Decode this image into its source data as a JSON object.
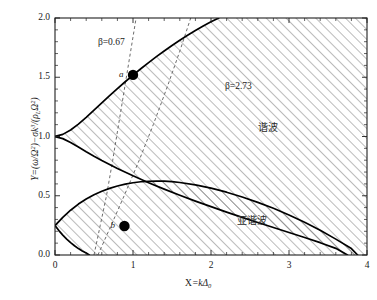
{
  "chart_data": {
    "type": "line",
    "title": "",
    "xlabel": "X=kΔ₀",
    "ylabel": "Y=(ω/Ω)²−σk³/(ρₗΩ²)",
    "xlim": [
      0,
      4
    ],
    "ylim": [
      0,
      2.0
    ],
    "grid": false,
    "legend": "none",
    "xticks": [
      "0",
      "1",
      "2",
      "3",
      "4"
    ],
    "xtick_values": [
      0,
      1,
      2,
      3,
      4
    ],
    "yticks": [
      "0.0",
      "0.5",
      "1.0",
      "1.5",
      "2.0"
    ],
    "ytick_values": [
      0.0,
      0.5,
      1.0,
      1.5,
      2.0
    ],
    "xminor_count": 4,
    "yminor_count": 4,
    "series": [
      {
        "name": "harmonic-upper-boundary",
        "style": "solid",
        "points": [
          [
            0.0,
            1.0
          ],
          [
            0.1,
            1.018
          ],
          [
            0.2,
            1.055
          ],
          [
            0.3,
            1.105
          ],
          [
            0.4,
            1.162
          ],
          [
            0.5,
            1.222
          ],
          [
            0.6,
            1.283
          ],
          [
            0.7,
            1.344
          ],
          [
            0.8,
            1.404
          ],
          [
            0.9,
            1.462
          ],
          [
            1.0,
            1.518
          ],
          [
            1.1,
            1.572
          ],
          [
            1.2,
            1.624
          ],
          [
            1.3,
            1.674
          ],
          [
            1.4,
            1.722
          ],
          [
            1.5,
            1.768
          ],
          [
            1.6,
            1.812
          ],
          [
            1.7,
            1.854
          ],
          [
            1.8,
            1.894
          ],
          [
            1.9,
            1.932
          ],
          [
            2.0,
            1.968
          ],
          [
            2.1,
            2.0
          ]
        ]
      },
      {
        "name": "harmonic-lower-boundary",
        "style": "solid",
        "points": [
          [
            0.0,
            1.0
          ],
          [
            0.1,
            0.982
          ],
          [
            0.2,
            0.95
          ],
          [
            0.3,
            0.912
          ],
          [
            0.4,
            0.872
          ],
          [
            0.5,
            0.834
          ],
          [
            0.6,
            0.798
          ],
          [
            0.8,
            0.73
          ],
          [
            1.0,
            0.668
          ],
          [
            1.2,
            0.61
          ],
          [
            1.4,
            0.556
          ],
          [
            1.6,
            0.504
          ],
          [
            1.8,
            0.455
          ],
          [
            2.0,
            0.408
          ],
          [
            2.2,
            0.362
          ],
          [
            2.4,
            0.318
          ],
          [
            2.6,
            0.274
          ],
          [
            2.8,
            0.232
          ],
          [
            3.0,
            0.19
          ],
          [
            3.2,
            0.148
          ],
          [
            3.4,
            0.104
          ],
          [
            3.6,
            0.056
          ],
          [
            3.75,
            0.0
          ]
        ]
      },
      {
        "name": "subharmonic-upper-boundary",
        "style": "solid",
        "points": [
          [
            0.0,
            0.248
          ],
          [
            0.1,
            0.318
          ],
          [
            0.2,
            0.378
          ],
          [
            0.3,
            0.43
          ],
          [
            0.4,
            0.472
          ],
          [
            0.5,
            0.508
          ],
          [
            0.6,
            0.538
          ],
          [
            0.7,
            0.562
          ],
          [
            0.8,
            0.582
          ],
          [
            0.9,
            0.598
          ],
          [
            1.0,
            0.61
          ],
          [
            1.1,
            0.618
          ],
          [
            1.2,
            0.622
          ],
          [
            1.3,
            0.624
          ],
          [
            1.4,
            0.623
          ],
          [
            1.5,
            0.619
          ],
          [
            1.6,
            0.612
          ],
          [
            1.8,
            0.592
          ],
          [
            2.0,
            0.564
          ],
          [
            2.2,
            0.53
          ],
          [
            2.4,
            0.49
          ],
          [
            2.6,
            0.444
          ],
          [
            2.8,
            0.394
          ],
          [
            3.0,
            0.338
          ],
          [
            3.2,
            0.276
          ],
          [
            3.4,
            0.208
          ],
          [
            3.6,
            0.134
          ],
          [
            3.8,
            0.054
          ],
          [
            3.88,
            0.0
          ]
        ]
      },
      {
        "name": "subharmonic-lower-boundary",
        "style": "solid",
        "points": [
          [
            0.0,
            0.248
          ],
          [
            0.05,
            0.206
          ],
          [
            0.1,
            0.168
          ],
          [
            0.15,
            0.134
          ],
          [
            0.2,
            0.104
          ],
          [
            0.25,
            0.078
          ],
          [
            0.3,
            0.054
          ],
          [
            0.35,
            0.034
          ],
          [
            0.4,
            0.016
          ],
          [
            0.44,
            0.0
          ]
        ]
      },
      {
        "name": "beta-0.67-line",
        "style": "dashed",
        "points": [
          [
            0.5,
            0.0
          ],
          [
            0.58,
            0.25
          ],
          [
            0.66,
            0.5
          ],
          [
            0.74,
            0.8
          ],
          [
            0.82,
            1.12
          ],
          [
            0.9,
            1.44
          ],
          [
            0.97,
            1.72
          ],
          [
            1.04,
            2.0
          ]
        ]
      },
      {
        "name": "beta-2.73-line",
        "style": "dashed",
        "points": [
          [
            0.55,
            0.0
          ],
          [
            0.72,
            0.25
          ],
          [
            0.9,
            0.52
          ],
          [
            1.08,
            0.8
          ],
          [
            1.26,
            1.1
          ],
          [
            1.44,
            1.42
          ],
          [
            1.6,
            1.72
          ],
          [
            1.74,
            2.0
          ]
        ]
      }
    ],
    "markers": [
      {
        "label": "a",
        "x": 1.0,
        "y": 1.52,
        "shape": "filled-circle",
        "color": "#000000"
      },
      {
        "label": "b",
        "x": 0.89,
        "y": 0.245,
        "shape": "filled-circle",
        "color": "#000000"
      }
    ],
    "annotations": [
      {
        "name": "beta-low-label",
        "text": "β=0.67",
        "x": 0.55,
        "y": 1.78
      },
      {
        "name": "beta-high-label",
        "text": "β=2.73",
        "x": 2.18,
        "y": 1.41
      },
      {
        "name": "harmonic-region-label",
        "text": "谐波",
        "x": 2.6,
        "y": 1.06
      },
      {
        "name": "subharmonic-region-label",
        "text": "亚谐波",
        "x": 2.33,
        "y": 0.275
      }
    ],
    "hatched_regions": [
      {
        "name": "harmonic-instability-region",
        "label": "谐波"
      },
      {
        "name": "subharmonic-instability-region",
        "label": "亚谐波"
      }
    ]
  },
  "axis": {
    "xlabel_prefix": "X",
    "xlabel_eq": "=k",
    "xlabel_delta": "Δ",
    "xlabel_sub": "0",
    "ylabel_y": "Y",
    "ylabel_eq": "=(",
    "ylabel_omega": "ω",
    "ylabel_slash": "/",
    "ylabel_bigomega": "Ω",
    "ylabel_sup2": "2",
    "ylabel_close": ")",
    "ylabel_minus": "−",
    "ylabel_sigma": "σ",
    "ylabel_k": "k",
    "ylabel_sup3": "3",
    "ylabel_div": "/(",
    "ylabel_rho": "ρ",
    "ylabel_subL": "L",
    "ylabel_tail": ")"
  },
  "style": {
    "curve_color": "#000000",
    "dashed_color": "#5a5a5a",
    "hatch_color": "#4d4d4d",
    "marker_color": "#000000",
    "background": "#ffffff"
  }
}
